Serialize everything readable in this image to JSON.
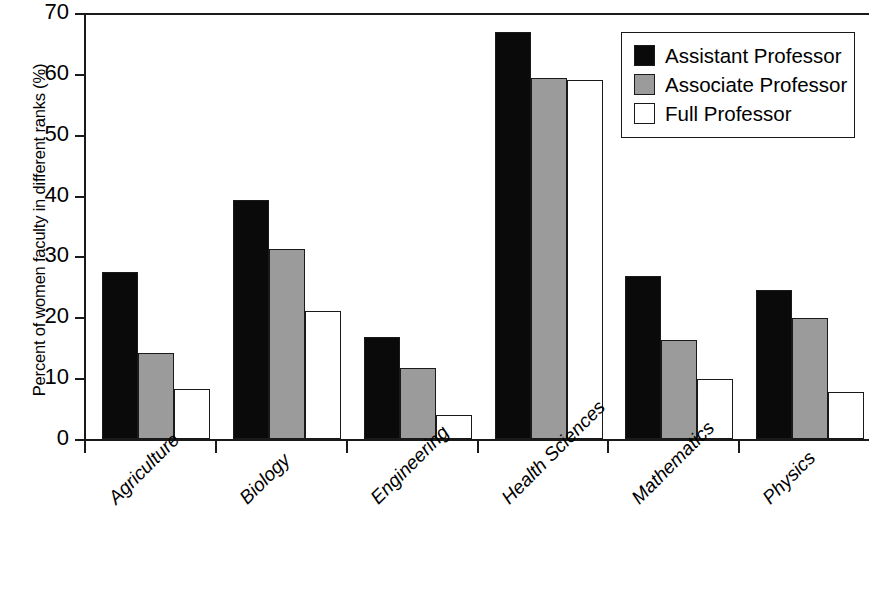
{
  "chart_data": {
    "type": "bar",
    "title": "",
    "xlabel": "",
    "ylabel": "Percent of women faculty in different ranks (%)",
    "ylim": [
      0,
      70
    ],
    "ytick_step": 10,
    "yticks": [
      0,
      10,
      20,
      30,
      40,
      50,
      60,
      70
    ],
    "ytick_labels": [
      "0",
      "10",
      "20",
      "30",
      "40",
      "50",
      "60",
      "70"
    ],
    "grid": false,
    "legend_position": "top-right",
    "categories": [
      "Agriculture",
      "Biology",
      "Engineering",
      "Health Sciences",
      "Mathematics",
      "Physics"
    ],
    "series": [
      {
        "name": "Assistant Professor",
        "color": "#0a0a0a",
        "values": [
          27.5,
          39.2,
          16.7,
          66.8,
          26.8,
          24.5
        ]
      },
      {
        "name": "Associate Professor",
        "color": "#9b9b9b",
        "values": [
          14.1,
          31.3,
          11.7,
          59.4,
          16.2,
          19.9
        ]
      },
      {
        "name": "Full Professor",
        "color": "#ffffff",
        "values": [
          8.2,
          21.0,
          4.0,
          59.0,
          9.9,
          7.8
        ]
      }
    ]
  },
  "legend": {
    "items": [
      {
        "label": "Assistant Professor",
        "swatch": "assistant"
      },
      {
        "label": "Associate Professor",
        "swatch": "associate"
      },
      {
        "label": "Full Professor",
        "swatch": "full"
      }
    ]
  },
  "colors": {
    "assistant": "#0a0a0a",
    "associate": "#9b9b9b",
    "full": "#ffffff",
    "axis": "#1a1a1a",
    "background": "#ffffff"
  }
}
